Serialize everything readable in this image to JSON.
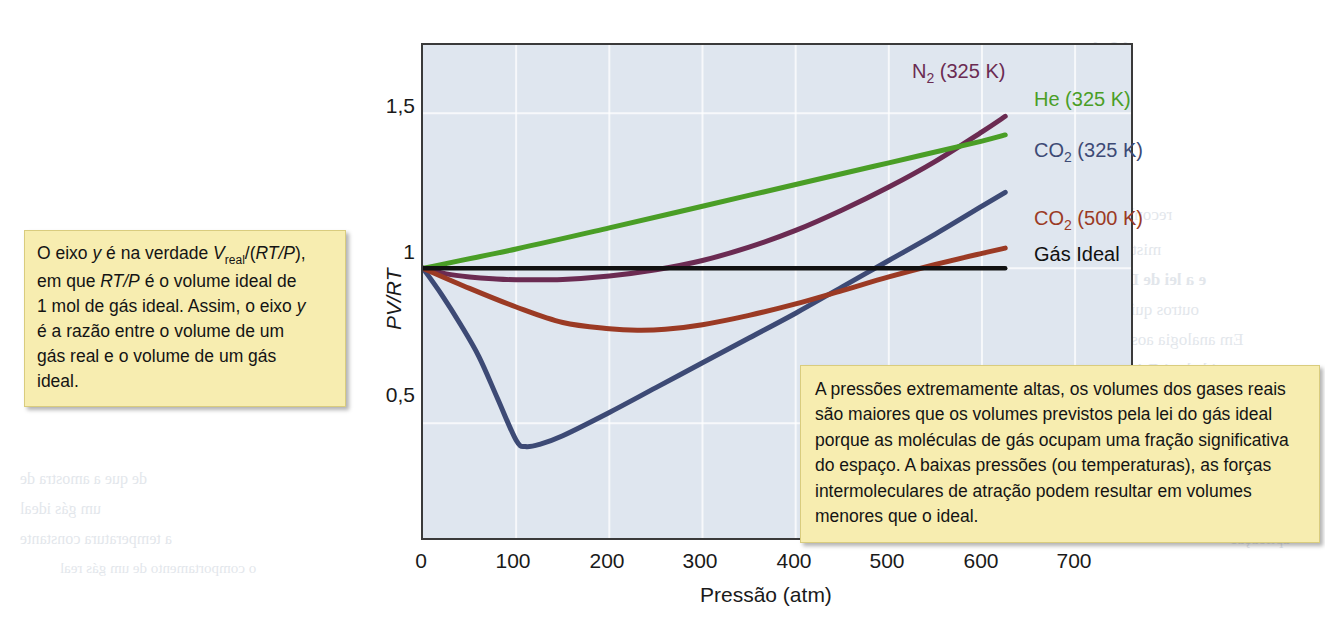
{
  "chart_data": {
    "type": "line",
    "title": "",
    "xlabel": "Pressão (atm)",
    "ylabel": "PV/RT",
    "xlim": [
      0,
      760
    ],
    "ylim": [
      0.13,
      1.72
    ],
    "xticks": [
      "0",
      "100",
      "200",
      "300",
      "400",
      "500",
      "600",
      "700"
    ],
    "xtick_values": [
      0,
      100,
      200,
      300,
      400,
      500,
      600,
      700
    ],
    "yticks": [
      "0,5",
      "1",
      "1,5"
    ],
    "ytick_values": [
      0.5,
      1.0,
      1.5
    ],
    "grid": true,
    "legend_position": "right-inline-labels",
    "series": [
      {
        "name": "N2 (325 K)",
        "label": "N",
        "label_sub": "2",
        "label_rest": " (325 K)",
        "color": "#6b2b52",
        "x": [
          0,
          25,
          50,
          75,
          100,
          150,
          200,
          250,
          300,
          350,
          400,
          450,
          500,
          550,
          600,
          625
        ],
        "y": [
          1.0,
          0.982,
          0.972,
          0.966,
          0.963,
          0.964,
          0.975,
          0.995,
          1.025,
          1.068,
          1.122,
          1.188,
          1.262,
          1.345,
          1.44,
          1.49
        ]
      },
      {
        "name": "He (325 K)",
        "label": "He (325 K)",
        "color": "#4a9e26",
        "x": [
          0,
          100,
          200,
          300,
          400,
          500,
          600,
          625
        ],
        "y": [
          1.0,
          1.062,
          1.13,
          1.2,
          1.27,
          1.34,
          1.41,
          1.43
        ]
      },
      {
        "name": "CO2 (325 K)",
        "label": "CO",
        "label_sub": "2",
        "label_rest": " (325 K)",
        "color": "#3d4a75",
        "x": [
          0,
          20,
          40,
          60,
          80,
          100,
          110,
          125,
          150,
          200,
          250,
          300,
          350,
          400,
          450,
          500,
          550,
          600,
          625
        ],
        "y": [
          1.0,
          0.915,
          0.82,
          0.715,
          0.58,
          0.445,
          0.425,
          0.432,
          0.46,
          0.535,
          0.615,
          0.695,
          0.775,
          0.855,
          0.94,
          1.025,
          1.11,
          1.2,
          1.245
        ]
      },
      {
        "name": "CO2 (500 K)",
        "label": "CO",
        "label_sub": "2",
        "label_rest": " (500 K)",
        "color": "#9b3a24",
        "x": [
          0,
          50,
          100,
          150,
          200,
          230,
          260,
          300,
          350,
          400,
          450,
          500,
          550,
          600,
          625
        ],
        "y": [
          1.0,
          0.935,
          0.875,
          0.825,
          0.805,
          0.8,
          0.803,
          0.818,
          0.848,
          0.885,
          0.928,
          0.972,
          1.012,
          1.048,
          1.065
        ]
      },
      {
        "name": "Gás Ideal",
        "label": "Gás Ideal",
        "color": "#111111",
        "x": [
          0,
          625
        ],
        "y": [
          1.0,
          1.0
        ]
      }
    ]
  },
  "annotations": {
    "left": {
      "line1_a": "O eixo ",
      "line1_y": "y",
      "line1_b": " é na verdade ",
      "line1_v": "V",
      "line1_vsub": "real",
      "line1_c": "/(",
      "line1_rtp": "RT/P",
      "line1_d": "),",
      "line2_a": "em que ",
      "line2_rtp": "RT/P",
      "line2_b": " é o volume ideal de",
      "line3_a": "1 mol de gás ideal. Assim, o eixo ",
      "line3_y": "y",
      "line4": "é a razão entre o volume de um",
      "line5": "gás real e o volume de um gás",
      "line6": "ideal."
    },
    "right": {
      "text": "A pressões extremamente altas, os volumes dos gases reais são maiores que os volumes previstos pela lei do gás ideal porque as moléculas de gás ocupam uma fração significativa do espaço.  A baixas pressões (ou temperaturas), as forças intermoleculares de atração podem resultar em volumes menores que o ideal."
    }
  },
  "bleed_through": {
    "t1": "A Estrutura e a",
    "t2": "10.1",
    "t3": "OS",
    "t4": "reconhecida",
    "t5": "mistura de",
    "t6": "e a lei de Dalton",
    "t7": "outros químicos",
    "t8": "Em analogia aos gases",
    "t9": "quantidade, 1 DALTON",
    "t10": "Como",
    "t11": "la a uma temperatura",
    "t12": "a 9 atmosferas",
    "t13": "de que a amostra de",
    "t14": "um gás ideal",
    "t15": "a temperatura constante",
    "t16": "aplicação",
    "t17": "o comportamento de um gás real"
  }
}
